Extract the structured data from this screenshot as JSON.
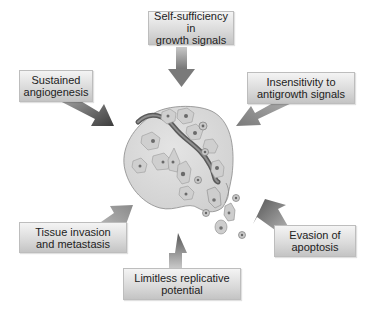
{
  "diagram": {
    "center": "tumor-cell-mass",
    "hallmarks": [
      {
        "id": "self-sufficiency",
        "line1": "Self-sufficiency in",
        "line2": "growth signals"
      },
      {
        "id": "insensitivity",
        "line1": "Insensitivity to",
        "line2": "antigrowth signals"
      },
      {
        "id": "evasion",
        "line1": "Evasion of",
        "line2": "apoptosis"
      },
      {
        "id": "limitless",
        "line1": "Limitless replicative",
        "line2": "potential"
      },
      {
        "id": "tissue-invasion",
        "line1": "Tissue invasion",
        "line2": "and metastasis"
      },
      {
        "id": "angiogenesis",
        "line1": "Sustained",
        "line2": "angiogenesis"
      }
    ],
    "colors": {
      "box_light": "#f4f4f4",
      "box_dark": "#c4c4c4",
      "arrow": "#8a8a8a",
      "arrow_dark": "#555555",
      "tissue": "#d8d8d8",
      "vessel": "#6e6e6e"
    }
  }
}
